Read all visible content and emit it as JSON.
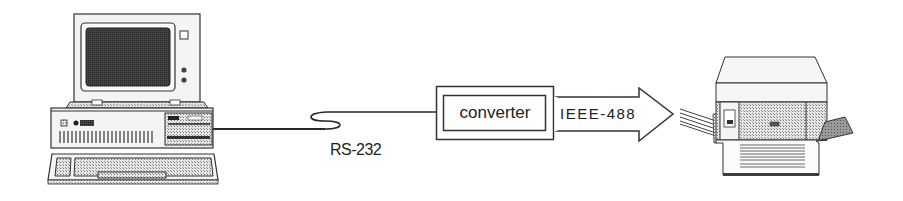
{
  "diagram": {
    "nodes": [
      {
        "id": "computer",
        "label": "",
        "type": "desktop-pc-illustration"
      },
      {
        "id": "converter",
        "label": "converter",
        "type": "box"
      },
      {
        "id": "printer",
        "label": "",
        "type": "laser-printer-illustration"
      }
    ],
    "edges": [
      {
        "from": "computer",
        "to": "converter",
        "label": "RS-232",
        "style": "cable"
      },
      {
        "from": "converter",
        "to": "printer",
        "label": "IEEE-488",
        "style": "block-arrow"
      }
    ],
    "labels": {
      "converter": "converter",
      "rs232": "RS-232",
      "ieee488": "IEEE-488"
    },
    "colors": {
      "line": "#2a2a2a",
      "fill_light": "#f4f4f4",
      "fill_dither": "#bdbdbd",
      "screen": "#3a3a3a",
      "background": "#ffffff"
    }
  }
}
